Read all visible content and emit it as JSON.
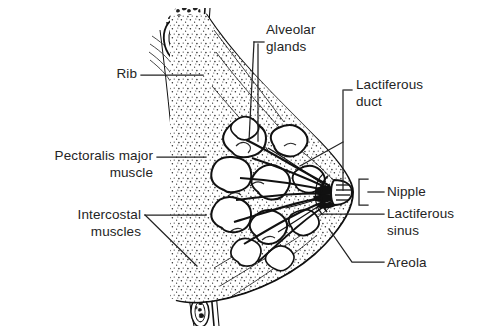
{
  "figure": {
    "type": "anatomical-line-diagram",
    "background_color": "#ffffff",
    "ink_color": "#1a1a1a",
    "width": 486,
    "height": 326
  },
  "labels": {
    "rib": "Rib",
    "pectoralis": "Pectoralis major\nmuscle",
    "intercostal": "Intercostal\nmuscles",
    "alveolar": "Alveolar\nglands",
    "lactiferous_duct": "Lactiferous\nduct",
    "nipple": "Nipple",
    "lactiferous_sinus": "Lactiferous\nsinus",
    "areola": "Areola"
  },
  "callouts": [
    {
      "name": "rib",
      "side": "left",
      "leader": "straight",
      "text_anchor": [
        137,
        75
      ],
      "target": [
        205,
        75
      ]
    },
    {
      "name": "pectoralis-major-muscle",
      "side": "left",
      "leader": "straight",
      "text_anchor": [
        152,
        157
      ],
      "target": [
        208,
        157
      ]
    },
    {
      "name": "intercostal-muscles",
      "side": "left",
      "leader": "forked",
      "text_anchor": [
        143,
        216
      ],
      "target": [
        207,
        215
      ]
    },
    {
      "name": "alveolar-glands",
      "side": "top",
      "leader": "bracket-down",
      "text_anchor": [
        264,
        40
      ],
      "target": [
        252,
        140
      ]
    },
    {
      "name": "lactiferous-duct",
      "side": "right",
      "leader": "bracket-left",
      "text_anchor": [
        358,
        97
      ],
      "target": [
        300,
        165
      ]
    },
    {
      "name": "nipple",
      "side": "right",
      "leader": "square-bracket",
      "text_anchor": [
        390,
        192
      ],
      "target": [
        358,
        192
      ]
    },
    {
      "name": "lactiferous-sinus",
      "side": "right",
      "leader": "straight",
      "text_anchor": [
        390,
        214
      ],
      "target": [
        318,
        214
      ]
    },
    {
      "name": "areola",
      "side": "right",
      "leader": "elbow",
      "text_anchor": [
        390,
        263
      ],
      "target": [
        328,
        229
      ]
    }
  ],
  "structures": [
    "rib-cross-section-upper",
    "rib-cross-section-middle",
    "rib-cross-section-lower",
    "intercostal-muscle-band",
    "pectoralis-major-muscle-layer",
    "adipose-tissue",
    "alveolar-gland-lobules",
    "lactiferous-ducts",
    "lactiferous-sinus",
    "nipple",
    "areola",
    "suspensory-ligaments",
    "skin-outline"
  ]
}
